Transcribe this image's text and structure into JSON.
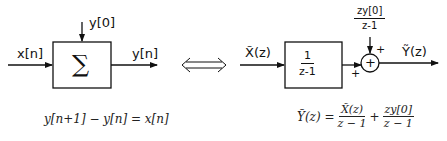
{
  "left_system": {
    "input_label": "x[n]",
    "initial_condition_label": "y[0]",
    "block_symbol": "∑",
    "output_label": "y[n]",
    "equation": "y[n+1] − y[n] = x[n]"
  },
  "equivalence_symbol": "⟺",
  "right_system": {
    "input_label": "X̃(z)",
    "transfer_numerator": "1",
    "transfer_denominator": "z-1",
    "ic_numerator": "zy[0]",
    "ic_denominator": "z-1",
    "summer_symbol": "+",
    "sign_top": "+",
    "sign_left": "+",
    "output_label": "Ỹ(z)",
    "equation_lhs": "Ỹ(z) =",
    "equation_term1_num": "X̃(z)",
    "equation_term1_den": "z − 1",
    "equation_plus": "+",
    "equation_term2_num": "zy[0]",
    "equation_term2_den": "z − 1"
  }
}
